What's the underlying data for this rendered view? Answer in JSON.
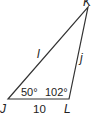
{
  "diagram": {
    "type": "triangle",
    "vertices": {
      "J": {
        "label": "J",
        "x": 8,
        "y": 99
      },
      "L": {
        "label": "L",
        "x": 69,
        "y": 99
      },
      "K": {
        "label": "K",
        "x": 88,
        "y": 7
      }
    },
    "sides": {
      "JK": {
        "label": "l"
      },
      "KL": {
        "label": "j"
      },
      "JL": {
        "label": "10"
      }
    },
    "angles": {
      "J": {
        "label": "50°"
      },
      "L": {
        "label": "102°"
      }
    },
    "stroke_color": "#333333"
  }
}
